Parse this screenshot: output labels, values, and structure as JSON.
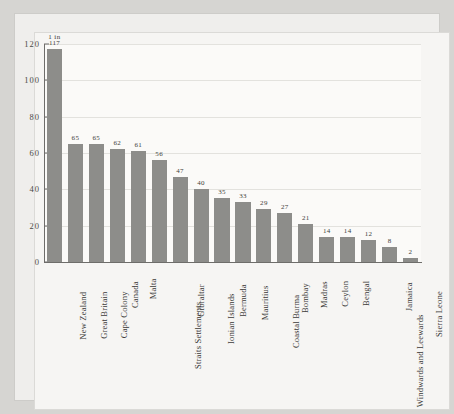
{
  "figure": {
    "top_note": "1 in",
    "bar_color": "#8d8d8a",
    "axis_color": "#6e6d6a",
    "page_color": "#efeeec",
    "plot_color": "#fbfaf8"
  },
  "chart_data": {
    "type": "bar",
    "title": "",
    "subtitle": "",
    "xlabel": "",
    "ylabel": "",
    "ylim": [
      0,
      120
    ],
    "yticks": [
      0,
      20,
      40,
      60,
      80,
      100,
      120
    ],
    "ytick_labels": [
      "0",
      "20",
      "40",
      "60",
      "80",
      "100",
      "120"
    ],
    "grid": true,
    "legend": null,
    "annotations": [
      "1 in"
    ],
    "categories": [
      "New Zealand",
      "Great Britain",
      "Cape Colony",
      "Canada",
      "Malta",
      "Straits Settlements",
      "Gibraltar",
      "Ionian Islands",
      "Bermuda",
      "Mauritius",
      "Coastal Burma",
      "Bombay",
      "Madras",
      "Ceylon",
      "Bengal",
      "Windwards and Leewards",
      "Jamaica",
      "Sierra Leone"
    ],
    "values": [
      117,
      65,
      65,
      62,
      61,
      56,
      47,
      40,
      35,
      33,
      29,
      27,
      21,
      14,
      14,
      12,
      8,
      2
    ],
    "value_labels": [
      "117",
      "65",
      "65",
      "62",
      "61",
      "56",
      "47",
      "40",
      "35",
      "33",
      "29",
      "27",
      "21",
      "14",
      "14",
      "12",
      "8",
      "2"
    ]
  }
}
